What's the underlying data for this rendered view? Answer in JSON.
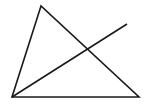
{
  "diagram": {
    "type": "geometry",
    "stroke_color": "#1a1a1a",
    "background": "#ffffff",
    "triangle": {
      "vertices": [
        {
          "x": 41,
          "y": 6
        },
        {
          "x": 12,
          "y": 97
        },
        {
          "x": 139,
          "y": 97
        }
      ]
    },
    "segment": {
      "from": {
        "x": 12,
        "y": 97
      },
      "to": {
        "x": 127,
        "y": 24
      }
    }
  }
}
